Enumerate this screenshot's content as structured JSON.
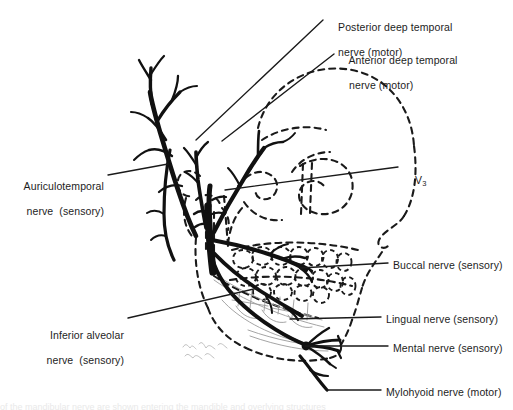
{
  "figure": {
    "background_color": "#ffffff",
    "ink_color": "#111111",
    "text_color": "#1d1d1d",
    "light_ink_color": "#8d8d8d",
    "width": 513,
    "height": 410
  },
  "labels": {
    "posterior_deep_temporal": {
      "line1": "Posterior deep temporal",
      "line2": "nerve (motor)",
      "x": 326,
      "y": 8
    },
    "anterior_deep_temporal": {
      "line1": "Anterior deep temporal",
      "line2": "nerve (motor)",
      "x": 337,
      "y": 41
    },
    "auriculotemporal": {
      "line1": "Auriculotemporal",
      "line2": "nerve  (sensory)",
      "x": 8,
      "y": 167
    },
    "inferior_alveolar": {
      "line1": "Inferior alveolar",
      "line2": "nerve  (sensory)",
      "x": 20,
      "y": 316
    },
    "v3": {
      "text": "V",
      "subscript": "3",
      "x": 403,
      "y": 161
    },
    "buccal": {
      "text": "Buccal nerve (sensory)",
      "x": 393,
      "y": 259
    },
    "lingual": {
      "text": "Lingual nerve (sensory)",
      "x": 386,
      "y": 313
    },
    "mental": {
      "text": "Mental nerve (sensory)",
      "x": 393,
      "y": 342
    },
    "mylohyoid": {
      "text": "Mylohyoid nerve (motor)",
      "x": 386,
      "y": 386
    },
    "signature": {
      "text": "B.H. Aladdin",
      "x": 182,
      "y": 346
    },
    "bottom_cutoff": {
      "text": "of the mandibular nerve are shown entering the mandible and overlying structures"
    }
  },
  "leaders": [
    {
      "name": "posterior-deep-temporal-leader",
      "x1": 323,
      "y1": 20,
      "x2": 196,
      "y2": 140
    },
    {
      "name": "anterior-deep-temporal-leader",
      "x1": 334,
      "y1": 54,
      "x2": 222,
      "y2": 141
    },
    {
      "name": "auriculotemporal-leader",
      "x1": 108,
      "y1": 175,
      "x2": 168,
      "y2": 164
    },
    {
      "name": "v3-leader",
      "x1": 398,
      "y1": 167,
      "x2": 225,
      "y2": 190
    },
    {
      "name": "buccal-leader",
      "x1": 388,
      "y1": 263,
      "x2": 300,
      "y2": 268
    },
    {
      "name": "lingual-leader",
      "x1": 381,
      "y1": 317,
      "x2": 290,
      "y2": 319
    },
    {
      "name": "mental-leader",
      "x1": 388,
      "y1": 346,
      "x2": 305,
      "y2": 346
    },
    {
      "name": "inferior-alveolar-leader",
      "x1": 128,
      "y1": 318,
      "x2": 258,
      "y2": 288
    },
    {
      "name": "mylohyoid-leader",
      "x1": 381,
      "y1": 390,
      "x2": 327,
      "y2": 390
    }
  ],
  "anatomy": {
    "nerve_trunks": [
      "auriculotemporal-nerve",
      "posterior-deep-temporal-nerve",
      "anterior-deep-temporal-nerve",
      "mandibular-trunk",
      "buccal-nerve",
      "lingual-nerve",
      "inferior-alveolar-nerve",
      "mental-nerve",
      "mylohyoid-nerve"
    ],
    "dashed_structures": [
      "skull-outline",
      "orbital-rim",
      "zygomatic-arch",
      "nasal-aperture",
      "maxillary-teeth",
      "mandibular-teeth",
      "mandible-outline",
      "coronoid-process",
      "condyle"
    ]
  }
}
